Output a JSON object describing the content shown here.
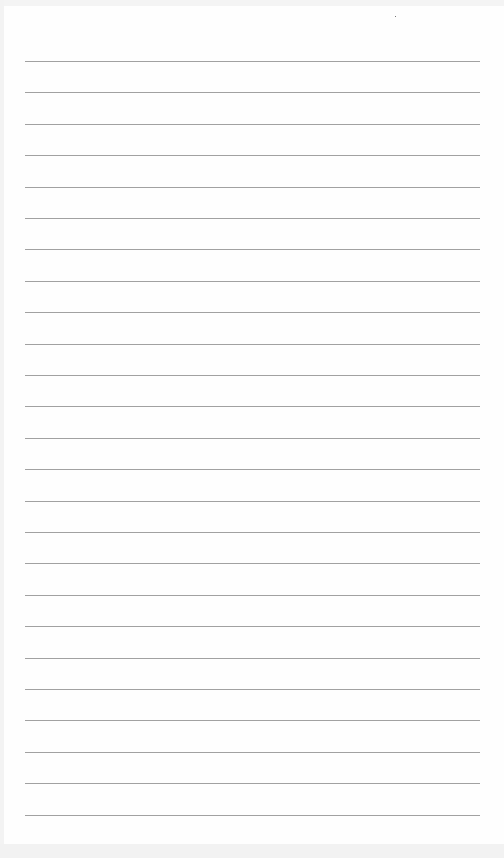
{
  "page": {
    "type": "lined-paper",
    "background_color": "#fefefe",
    "line_color": "#8a8a8a",
    "line_count": 25,
    "first_line_y": 61,
    "line_spacing": 31.4,
    "line_left": 25,
    "line_width": 455
  }
}
